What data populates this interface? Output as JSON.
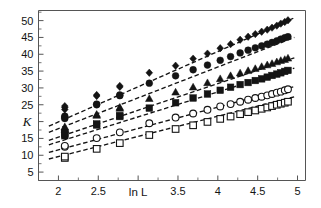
{
  "figure": {
    "name": "scaling-plot",
    "background_color": "#ffffff",
    "frame_color": "#555555",
    "ink_color": "#141414"
  },
  "chart_data": {
    "type": "scatter",
    "title": "",
    "subtitle": "",
    "xlabel": "ln L",
    "ylabel": "K",
    "xlim": [
      1.75,
      5.1
    ],
    "ylim": [
      2.5,
      53
    ],
    "grid": false,
    "legend": "none",
    "xticks": [
      2,
      2.5,
      3,
      3.5,
      4,
      4.5,
      5
    ],
    "xtick_labels": [
      "2",
      "2.5",
      "",
      "3.5",
      "4",
      "4.5",
      "5"
    ],
    "xtick_minor_step": 0.25,
    "yticks": [
      5,
      10,
      15,
      20,
      25,
      30,
      35,
      40,
      45,
      50
    ],
    "ytick_labels": [
      "5",
      "10",
      "15",
      "",
      "25",
      "30",
      "35",
      "40",
      "45",
      "50"
    ],
    "ytick_minor_step": 2.5,
    "note_xlabel_overlaps_tick": "3",
    "note_ylabel_overlaps_tick": "20",
    "series": [
      {
        "name": "series-1",
        "marker": "filled-diamond",
        "marker_size": 6.4,
        "fit_line": "dashed",
        "fit_intercept": -1.0,
        "fit_slope": 10.45,
        "fit_x_range": [
          1.88,
          4.96
        ],
        "x": [
          2.08,
          2.08,
          2.08,
          2.48,
          2.48,
          2.77,
          2.77,
          3.14,
          3.47,
          3.69,
          3.87,
          4.03,
          4.16,
          4.28,
          4.38,
          4.47,
          4.55,
          4.62,
          4.68,
          4.74,
          4.79,
          4.84,
          4.88
        ],
        "y": [
          23.6,
          24.2,
          24.6,
          27.6,
          27.9,
          30.3,
          30.6,
          34.5,
          36.6,
          38.7,
          40.2,
          41.8,
          43.0,
          44.3,
          45.2,
          46.0,
          46.7,
          47.3,
          47.9,
          48.5,
          49.1,
          49.6,
          50.1
        ]
      },
      {
        "name": "series-2",
        "marker": "filled-circle",
        "marker_size": 6.8,
        "fit_line": "dashed",
        "fit_intercept": -0.4,
        "fit_slope": 9.15,
        "fit_x_range": [
          1.88,
          4.96
        ],
        "x": [
          2.08,
          2.08,
          2.08,
          2.48,
          2.48,
          2.77,
          2.77,
          3.14,
          3.47,
          3.69,
          3.87,
          4.03,
          4.16,
          4.28,
          4.38,
          4.47,
          4.55,
          4.62,
          4.68,
          4.74,
          4.79,
          4.84,
          4.88
        ],
        "y": [
          20.9,
          21.3,
          21.6,
          25.0,
          25.2,
          27.7,
          27.9,
          31.4,
          33.6,
          35.4,
          36.8,
          38.2,
          39.3,
          40.4,
          41.2,
          41.9,
          42.5,
          43.0,
          43.5,
          44.0,
          44.5,
          44.9,
          45.2
        ]
      },
      {
        "name": "series-3",
        "marker": "filled-triangle",
        "marker_size": 6.6,
        "fit_line": "dashed",
        "fit_intercept": -0.5,
        "fit_slope": 7.95,
        "fit_x_range": [
          1.88,
          4.96
        ],
        "x": [
          2.08,
          2.08,
          2.08,
          2.48,
          2.48,
          2.77,
          2.77,
          3.14,
          3.47,
          3.69,
          3.87,
          4.03,
          4.16,
          4.28,
          4.38,
          4.47,
          4.55,
          4.62,
          4.68,
          4.74,
          4.79,
          4.84,
          4.88
        ],
        "y": [
          17.6,
          18.0,
          18.4,
          21.8,
          22.1,
          23.9,
          24.2,
          26.8,
          28.7,
          30.2,
          31.5,
          32.7,
          33.6,
          34.4,
          35.1,
          35.7,
          36.3,
          36.8,
          37.2,
          37.7,
          38.1,
          38.4,
          38.8
        ]
      },
      {
        "name": "series-4",
        "marker": "filled-square",
        "marker_size": 6.6,
        "fit_line": "dashed",
        "fit_intercept": -0.8,
        "fit_slope": 7.4,
        "fit_x_range": [
          1.88,
          4.96
        ],
        "x": [
          2.08,
          2.08,
          2.08,
          2.48,
          2.48,
          2.77,
          2.77,
          3.14,
          3.47,
          3.69,
          3.87,
          4.03,
          4.16,
          4.28,
          4.38,
          4.47,
          4.55,
          4.62,
          4.68,
          4.74,
          4.79,
          4.84,
          4.88
        ],
        "y": [
          15.8,
          16.2,
          16.6,
          19.0,
          19.3,
          21.5,
          21.8,
          24.0,
          25.6,
          27.0,
          28.2,
          29.3,
          30.2,
          31.0,
          31.6,
          32.2,
          32.7,
          33.2,
          33.7,
          34.1,
          34.5,
          34.9,
          35.2
        ]
      },
      {
        "name": "series-5",
        "marker": "open-circle",
        "marker_size": 6.8,
        "fit_line": "dashed",
        "fit_intercept": -1.1,
        "fit_slope": 6.35,
        "fit_x_range": [
          1.88,
          4.96
        ],
        "x": [
          2.08,
          2.08,
          2.48,
          2.77,
          3.14,
          3.47,
          3.69,
          3.87,
          4.03,
          4.16,
          4.28,
          4.38,
          4.47,
          4.55,
          4.62,
          4.68,
          4.74,
          4.79,
          4.84,
          4.88
        ],
        "y": [
          12.5,
          12.8,
          15.1,
          16.8,
          19.5,
          21.2,
          22.4,
          23.5,
          24.5,
          25.2,
          25.9,
          26.5,
          27.0,
          27.4,
          27.8,
          28.2,
          28.6,
          28.9,
          29.3,
          29.6
        ]
      },
      {
        "name": "series-6",
        "marker": "open-square",
        "marker_size": 6.6,
        "fit_line": "dashed",
        "fit_intercept": -2.4,
        "fit_slope": 6.0,
        "fit_x_range": [
          1.88,
          4.96
        ],
        "x": [
          2.08,
          2.08,
          2.48,
          2.77,
          3.14,
          3.47,
          3.69,
          3.87,
          4.03,
          4.16,
          4.28,
          4.38,
          4.47,
          4.55,
          4.62,
          4.68,
          4.74,
          4.79,
          4.84,
          4.88
        ],
        "y": [
          9.2,
          9.6,
          11.9,
          13.6,
          16.0,
          17.8,
          18.9,
          19.9,
          20.8,
          21.5,
          22.2,
          22.8,
          23.3,
          23.8,
          24.2,
          24.6,
          25.0,
          25.3,
          25.6,
          25.9
        ]
      }
    ]
  }
}
